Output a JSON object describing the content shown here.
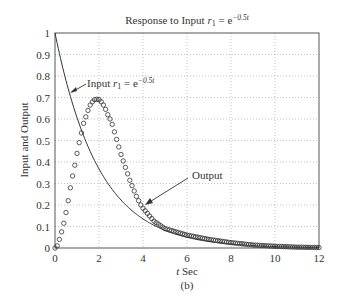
{
  "chart_data": {
    "type": "line",
    "title_parts": {
      "prefix": "Response to Input ",
      "var": "r",
      "sub": "1",
      "eq": " = e",
      "sup": "−0.5t"
    },
    "xlabel": "t Sec",
    "xlabel_parts": {
      "var": "t",
      "rest": " Sec"
    },
    "ylabel": "Input and Output",
    "caption": "(b)",
    "xlim": [
      0,
      12
    ],
    "ylim": [
      0,
      1
    ],
    "xticks": [
      0,
      2,
      4,
      6,
      8,
      10,
      12
    ],
    "yticks": [
      0,
      0.1,
      0.2,
      0.3,
      0.4,
      0.5,
      0.6,
      0.7,
      0.8,
      0.9,
      1
    ],
    "ytick_labels": [
      "0",
      "0.1",
      "0.2",
      "0.3",
      "0.4",
      "0.5",
      "0.6",
      "0.7",
      "0.8",
      "0.9",
      "1"
    ],
    "grid": true,
    "series": [
      {
        "name": "Input r1 = e^{-0.5t}",
        "style": "solid-line",
        "x": [
          0,
          0.5,
          1,
          1.5,
          2,
          2.5,
          3,
          3.5,
          4,
          5,
          6,
          7,
          8,
          9,
          10,
          11,
          12
        ],
        "values": [
          1.0,
          0.779,
          0.607,
          0.472,
          0.368,
          0.287,
          0.223,
          0.174,
          0.135,
          0.082,
          0.05,
          0.03,
          0.018,
          0.011,
          0.007,
          0.004,
          0.002
        ]
      },
      {
        "name": "Output",
        "style": "circle-markers",
        "x": [
          0,
          0.1,
          0.2,
          0.3,
          0.4,
          0.5,
          0.6,
          0.7,
          0.8,
          0.9,
          1.0,
          1.1,
          1.2,
          1.3,
          1.4,
          1.5,
          1.6,
          1.7,
          1.8,
          1.9,
          2.0,
          2.1,
          2.2,
          2.3,
          2.4,
          2.5,
          2.6,
          2.7,
          2.8,
          2.9,
          3.0,
          3.1,
          3.2,
          3.3,
          3.4,
          3.5,
          3.6,
          3.7,
          3.8,
          3.9,
          4.0,
          4.5,
          5,
          6,
          7,
          8,
          9,
          10,
          11,
          12
        ],
        "values": [
          0.0,
          0.01,
          0.04,
          0.075,
          0.115,
          0.165,
          0.22,
          0.28,
          0.335,
          0.385,
          0.44,
          0.49,
          0.535,
          0.58,
          0.61,
          0.64,
          0.665,
          0.68,
          0.69,
          0.692,
          0.69,
          0.68,
          0.665,
          0.645,
          0.62,
          0.6,
          0.575,
          0.54,
          0.505,
          0.47,
          0.435,
          0.405,
          0.375,
          0.345,
          0.315,
          0.29,
          0.265,
          0.24,
          0.22,
          0.2,
          0.185,
          0.125,
          0.09,
          0.06,
          0.04,
          0.025,
          0.014,
          0.008,
          0.004,
          0.002
        ]
      }
    ],
    "annotations": [
      {
        "text": "Input r1 = e^{-0.5t}",
        "points_to": [
          0.6,
          0.7
        ]
      },
      {
        "text": "Output",
        "points_to": [
          4.0,
          0.19
        ]
      }
    ],
    "legend": null
  },
  "annotations_text": {
    "input_prefix": "Input ",
    "input_var": "r",
    "input_sub": "1",
    "input_eq": " = e",
    "input_sup": "−0.5t",
    "output": "Output"
  }
}
